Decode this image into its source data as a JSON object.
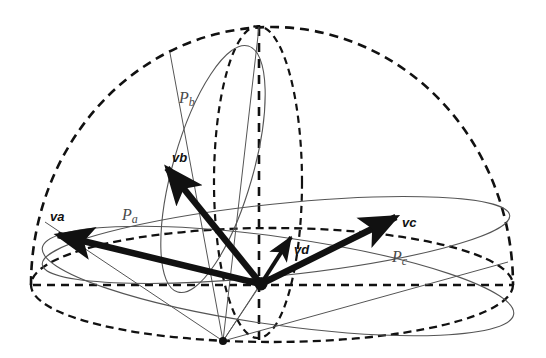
{
  "figure": {
    "background_color": "#ffffff",
    "stroke_color": "#111111",
    "thin_stroke_color": "#555555",
    "label_color_plane": "#4a4a4a",
    "label_color_vector": "#111111"
  },
  "geometry": {
    "dome": {
      "name": "hemisphere-outline",
      "apex": {
        "x": 258,
        "y": 27
      },
      "center": {
        "x": 272,
        "y": 285
      },
      "radius_x": 241,
      "radius_y": 258,
      "style": "dashed"
    },
    "base_ellipse": {
      "name": "base-equator",
      "cx": 272,
      "cy": 285,
      "rx": 241,
      "ry": 57,
      "style": "dashed"
    },
    "meridian_ellipse": {
      "name": "vertical-meridian",
      "cx": 258,
      "cy": 182,
      "rx": 44,
      "ry": 156,
      "style": "dashed"
    },
    "axis": {
      "name": "vertical-axis",
      "x": 259,
      "y_top": 27,
      "y_bottom": 341,
      "style": "dashed"
    },
    "horizontal_diameter": {
      "name": "horizontal-diameter",
      "y": 285,
      "x_left": 33,
      "x_right": 513,
      "style": "dashed"
    },
    "origin_node": {
      "x": 261,
      "y": 284,
      "r": 6
    },
    "bottom_node": {
      "x": 223,
      "y": 341,
      "r": 4
    }
  },
  "planes": [
    {
      "id": "Pa",
      "label": "P",
      "subscript": "a",
      "label_x": 122,
      "label_y": 220,
      "ellipse": {
        "cx": 276,
        "cy": 240,
        "rx": 235,
        "ry": 36,
        "rotate": -6
      },
      "style": "solid-thin"
    },
    {
      "id": "Pb",
      "label": "P",
      "subscript": "b",
      "label_x": 179,
      "label_y": 103,
      "ellipse": {
        "cx": 213,
        "cy": 169,
        "rx": 40,
        "ry": 128,
        "rotate": 16
      },
      "style": "solid-thin"
    },
    {
      "id": "Pc",
      "label": "P",
      "subscript": "c",
      "label_x": 392,
      "label_y": 262,
      "ellipse": {
        "cx": 278,
        "cy": 281,
        "rx": 238,
        "ry": 44,
        "rotate": 8
      },
      "style": "solid-thin"
    }
  ],
  "vectors": [
    {
      "id": "va",
      "label": "v",
      "subscript": "a",
      "label_x": 50,
      "label_y": 221,
      "from": {
        "x": 261,
        "y": 284
      },
      "to": {
        "x": 58,
        "y": 235
      },
      "weight": "thick"
    },
    {
      "id": "vb",
      "label": "v",
      "subscript": "b",
      "label_x": 172,
      "label_y": 162,
      "from": {
        "x": 261,
        "y": 284
      },
      "to": {
        "x": 167,
        "y": 168
      },
      "weight": "thick"
    },
    {
      "id": "vc",
      "label": "v",
      "subscript": "c",
      "label_x": 402,
      "label_y": 227,
      "from": {
        "x": 261,
        "y": 284
      },
      "to": {
        "x": 396,
        "y": 217
      },
      "weight": "thick"
    },
    {
      "id": "vd",
      "label": "v",
      "subscript": "d",
      "label_x": 294,
      "label_y": 254,
      "from": {
        "x": 261,
        "y": 284
      },
      "to": {
        "x": 291,
        "y": 237
      },
      "weight": "medium"
    }
  ],
  "guide_lines": [
    {
      "name": "guide-origin-to-bottom",
      "x1": 261,
      "y1": 284,
      "x2": 223,
      "y2": 341
    },
    {
      "name": "guide-bottom-to-pa-left",
      "x1": 223,
      "y1": 341,
      "x2": 45,
      "y2": 222
    },
    {
      "name": "guide-bottom-to-pb-top",
      "x1": 223,
      "y1": 341,
      "x2": 170,
      "y2": 53
    },
    {
      "name": "guide-bottom-to-axis",
      "x1": 223,
      "y1": 341,
      "x2": 259,
      "y2": 27
    },
    {
      "name": "guide-bottom-to-vd",
      "x1": 223,
      "y1": 341,
      "x2": 291,
      "y2": 237
    },
    {
      "name": "guide-bottom-to-pc-right",
      "x1": 223,
      "y1": 341,
      "x2": 508,
      "y2": 262
    }
  ]
}
